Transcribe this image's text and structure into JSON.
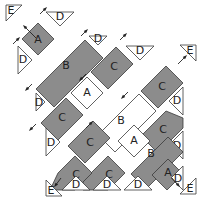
{
  "diagram": {
    "colors": {
      "dark_fabric": "#8c8c8c",
      "light_fabric": "#ffffff",
      "outline": "#3a3a3a"
    },
    "pieces": [
      {
        "id": "E1",
        "label": "E",
        "shape": "corner-triangle",
        "fill": "white",
        "points": "6,5 22,5 6,21",
        "lx": 11,
        "ly": 11
      },
      {
        "id": "A1",
        "label": "A",
        "shape": "square",
        "fill": "gray",
        "points": "38,23 54,39 38,55 22,39",
        "lx": 38,
        "ly": 40
      },
      {
        "id": "D1",
        "label": "D",
        "shape": "side-triangle",
        "fill": "white",
        "points": "46,12 74,12 60,26",
        "lx": 60,
        "ly": 17
      },
      {
        "id": "D2",
        "label": "D",
        "shape": "side-triangle",
        "fill": "white",
        "points": "18,46 18,74 32,60",
        "lx": 23,
        "ly": 60
      },
      {
        "id": "B1",
        "label": "B",
        "shape": "rectangle",
        "fill": "gray",
        "points": "85,40 103,58 54,107 36,89",
        "lx": 66,
        "ly": 66
      },
      {
        "id": "D3",
        "label": "D",
        "shape": "side-triangle",
        "fill": "white",
        "points": "89,36 107,36 98,45",
        "lx": 98,
        "ly": 39
      },
      {
        "id": "D4",
        "label": "D",
        "shape": "side-triangle",
        "fill": "white",
        "points": "36,93 36,111 45,102",
        "lx": 39,
        "ly": 103
      },
      {
        "id": "C1",
        "label": "C",
        "shape": "rectangle",
        "fill": "gray",
        "points": "116,47 133,64 108,89 91,72",
        "lx": 114,
        "ly": 67
      },
      {
        "id": "D5",
        "label": "D",
        "shape": "side-triangle",
        "fill": "white",
        "points": "126,46 154,46 140,60",
        "lx": 140,
        "ly": 51
      },
      {
        "id": "A2",
        "label": "A",
        "shape": "square",
        "fill": "white",
        "points": "87,77 103,93 87,109 71,93",
        "lx": 87,
        "ly": 93
      },
      {
        "id": "C2",
        "label": "C",
        "shape": "rectangle",
        "fill": "gray",
        "points": "66,98 83,115 58,140 41,123",
        "lx": 62,
        "ly": 118
      },
      {
        "id": "D6",
        "label": "D",
        "shape": "side-triangle",
        "fill": "white",
        "points": "46,128 46,156 60,142",
        "lx": 51,
        "ly": 143
      },
      {
        "id": "E2",
        "label": "E",
        "shape": "corner-triangle",
        "fill": "white",
        "points": "180,45 196,45 196,61",
        "lx": 190,
        "ly": 51
      },
      {
        "id": "C3",
        "label": "C",
        "shape": "rectangle",
        "fill": "gray",
        "points": "166,66 183,83 158,108 141,91",
        "lx": 162,
        "ly": 87
      },
      {
        "id": "D7",
        "label": "D",
        "shape": "side-triangle",
        "fill": "white",
        "points": "183,87 183,115 169,101",
        "lx": 177,
        "ly": 101
      },
      {
        "id": "B2",
        "label": "B",
        "shape": "rectangle",
        "fill": "white",
        "points": "139,94 156,111 115,152 98,135",
        "lx": 121,
        "ly": 121
      },
      {
        "id": "C4",
        "label": "C",
        "shape": "rectangle",
        "fill": "gray",
        "points": "183,118 183,128 158,153 141,136 166,111",
        "lx": 163,
        "ly": 130
      },
      {
        "id": "A3",
        "label": "A",
        "shape": "square",
        "fill": "white",
        "points": "134,125 150,141 134,157 118,141",
        "lx": 134,
        "ly": 141
      },
      {
        "id": "D8",
        "label": "D",
        "shape": "side-triangle",
        "fill": "white",
        "points": "183,131 183,159 169,145",
        "lx": 177,
        "ly": 146
      },
      {
        "id": "B3",
        "label": "B",
        "shape": "rectangle",
        "fill": "gray",
        "points": "168,137 183,152 146,189 131,174 ",
        "lx": 151,
        "ly": 154
      },
      {
        "id": "C5",
        "label": "C",
        "shape": "rectangle",
        "fill": "gray",
        "points": "93,121 110,138 85,163 68,146",
        "lx": 90,
        "ly": 143
      },
      {
        "id": "C6",
        "label": "C",
        "shape": "rectangle",
        "fill": "gray",
        "points": "108,156 125,173 108,190 83,190 83,181",
        "lx": 109,
        "ly": 175
      },
      {
        "id": "C7",
        "label": "C",
        "shape": "rectangle",
        "fill": "gray",
        "points": "75,156 92,173 75,190 50,190 58,173",
        "lx": 76,
        "ly": 175
      },
      {
        "id": "A4",
        "label": "A",
        "shape": "square",
        "fill": "gray",
        "points": "168,159 183,174 167,190 152,175",
        "lx": 168,
        "ly": 173
      },
      {
        "id": "D9",
        "label": "D",
        "shape": "side-triangle",
        "fill": "white",
        "points": "183,166 183,190 171,178",
        "lx": 178,
        "ly": 179
      },
      {
        "id": "D10",
        "label": "D",
        "shape": "side-triangle",
        "fill": "white",
        "points": "62,190 90,190 76,176",
        "lx": 76,
        "ly": 185
      },
      {
        "id": "D11",
        "label": "D",
        "shape": "side-triangle",
        "fill": "white",
        "points": "93,190 121,190 107,176",
        "lx": 107,
        "ly": 185
      },
      {
        "id": "D12",
        "label": "D",
        "shape": "side-triangle",
        "fill": "white",
        "points": "124,190 152,190 138,176",
        "lx": 138,
        "ly": 185
      },
      {
        "id": "E3",
        "label": "E",
        "shape": "corner-triangle",
        "fill": "white",
        "points": "46,180 46,196 62,196",
        "lx": 51,
        "ly": 191
      },
      {
        "id": "E4",
        "label": "E",
        "shape": "corner-triangle",
        "fill": "white",
        "points": "180,194 196,178 196,194",
        "lx": 190,
        "ly": 189
      }
    ],
    "arrows": [
      {
        "x1": 36,
        "y1": 38,
        "x2": 24,
        "y2": 26
      },
      {
        "x1": 13,
        "y1": 44,
        "x2": 19,
        "y2": 38
      },
      {
        "x1": 40,
        "y1": 14,
        "x2": 46,
        "y2": 8
      },
      {
        "x1": 32,
        "y1": 84,
        "x2": 26,
        "y2": 90
      },
      {
        "x1": 81,
        "y1": 36,
        "x2": 87,
        "y2": 30
      },
      {
        "x1": 120,
        "y1": 40,
        "x2": 126,
        "y2": 34
      },
      {
        "x1": 86,
        "y1": 74,
        "x2": 80,
        "y2": 80
      },
      {
        "x1": 128,
        "y1": 92,
        "x2": 122,
        "y2": 98
      },
      {
        "x1": 36,
        "y1": 124,
        "x2": 30,
        "y2": 130
      },
      {
        "x1": 86,
        "y1": 128,
        "x2": 92,
        "y2": 122
      },
      {
        "x1": 178,
        "y1": 64,
        "x2": 186,
        "y2": 56
      },
      {
        "x1": 61,
        "y1": 178,
        "x2": 55,
        "y2": 186
      },
      {
        "x1": 172,
        "y1": 178,
        "x2": 179,
        "y2": 186
      }
    ]
  }
}
